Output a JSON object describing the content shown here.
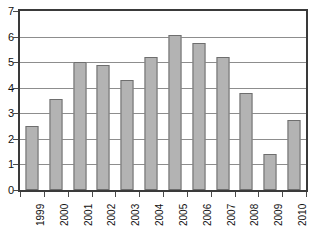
{
  "chart_data": {
    "type": "bar",
    "title": "",
    "xlabel": "",
    "ylabel": "",
    "categories": [
      "1999",
      "2000",
      "2001",
      "2002",
      "2003",
      "2004",
      "2005",
      "2006",
      "2007",
      "2008",
      "2009",
      "2010"
    ],
    "values": [
      2.5,
      3.55,
      5.0,
      4.9,
      4.3,
      5.2,
      6.05,
      5.75,
      5.2,
      3.8,
      1.4,
      2.75
    ],
    "ylim": [
      0,
      7
    ],
    "ytick_values": [
      0,
      1,
      2,
      3,
      4,
      5,
      6,
      7
    ],
    "ytick_labels": [
      "0",
      "1",
      "2",
      "3",
      "4",
      "5",
      "6",
      "7"
    ],
    "grid": true,
    "grid_axis": "y",
    "legend": false,
    "legend_position": "none",
    "xtick_label_rotation": 90,
    "series": [
      {
        "name": "",
        "values": [
          2.5,
          3.55,
          5.0,
          4.9,
          4.3,
          5.2,
          6.05,
          5.75,
          5.2,
          3.8,
          1.4,
          2.75
        ]
      }
    ]
  },
  "style": {
    "bar_fill": "#b3b3b3",
    "bar_border": "#6e6e6e",
    "gridline_color": "#8d8d8d",
    "axis_color": "#3a3a3a",
    "text_color": "#111111",
    "background": "#ffffff"
  },
  "title_remnant": {
    "text": ""
  }
}
